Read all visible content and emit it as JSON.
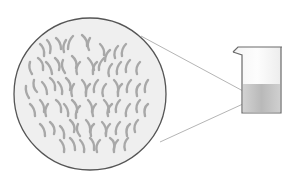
{
  "diagram": {
    "description": "Magnified view of curved rod-shaped microorganisms in a liquid sample inside a laboratory beaker",
    "colors": {
      "background": "#ffffff",
      "circle_fill": "#efefef",
      "circle_stroke": "#555555",
      "organism": "#a8a8a8",
      "zoom_lines": "#b5b5b5",
      "beaker_stroke": "#6a6a6a",
      "liquid": "#c4c4c4"
    },
    "magnified_view": {
      "cx": 90,
      "cy": 94,
      "r": 76,
      "label": "magnified-sample"
    },
    "beaker": {
      "label": "beaker",
      "rim_y": 47,
      "left_x": 242,
      "right_x": 281,
      "bottom_y": 113,
      "liquid_top_y": 84
    },
    "zoom_point": {
      "x": 256,
      "y": 98
    }
  }
}
